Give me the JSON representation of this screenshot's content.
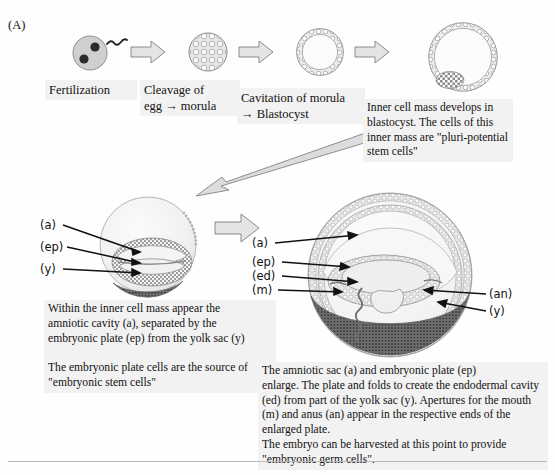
{
  "figure": {
    "panel_letter": "(A)",
    "background_color": "#fefefe",
    "text_box_color": "#f2f2f2",
    "arrow_fill": "#e4e4e4",
    "arrow_stroke": "#8a8a8a",
    "cell_fill": "#d8d8d8",
    "outline_color": "#7d7d7d"
  },
  "top_row": {
    "stages": [
      {
        "name": "fertilized-egg",
        "caption": "Fertilization"
      },
      {
        "name": "morula",
        "caption": "Cleavage of\negg → morula"
      },
      {
        "name": "blastocyst",
        "caption": "Cavitation of morula\n→ Blastocyst"
      },
      {
        "name": "blastocyst-with-inner-cell-mass",
        "caption": ""
      }
    ],
    "arrows": 3
  },
  "callouts": {
    "inner_cell_mass": "Inner cell mass develops in\nblastocyst. The cells of this\ninner mass are \"pluri-potential\nstem cells\"",
    "amniotic_cavity": "Within the inner cell mass appear the\namniotic cavity (a), separated by the\nembryonic plate (ep) from the yolk sac (y)\n\nThe embryonic plate cells are the source of\n\"embryonic stem cells\"",
    "enlarged_embryo": "        The amniotic sac (a) and embryonic plate (ep)\nenlarge. The plate and folds to create the endodermal cavity\n(ed) from part of the yolk sac (y). Apertures for the mouth\n(m) and anus (an) appear in the respective ends of the\nenlarged plate.\nThe embryo can be harvested at this point to provide\n\"embryonic germ cells\"."
  },
  "middle_diagram": {
    "name": "early-embryo-section",
    "labels": [
      {
        "key": "a",
        "text": "(a)"
      },
      {
        "key": "ep",
        "text": "(ep)"
      },
      {
        "key": "y",
        "text": "(y)"
      }
    ]
  },
  "right_diagram": {
    "name": "late-embryo-section",
    "labels_left": [
      {
        "key": "a",
        "text": "(a)"
      },
      {
        "key": "ep",
        "text": "(ep)"
      },
      {
        "key": "ed",
        "text": "(ed)"
      },
      {
        "key": "m",
        "text": "(m)"
      }
    ],
    "labels_right": [
      {
        "key": "an",
        "text": "(an)"
      },
      {
        "key": "y",
        "text": "(y)"
      }
    ]
  },
  "legend_keys": {
    "a": "amniotic cavity / amniotic sac",
    "ep": "embryonic plate",
    "y": "yolk sac",
    "ed": "endodermal cavity",
    "m": "mouth",
    "an": "anus"
  }
}
